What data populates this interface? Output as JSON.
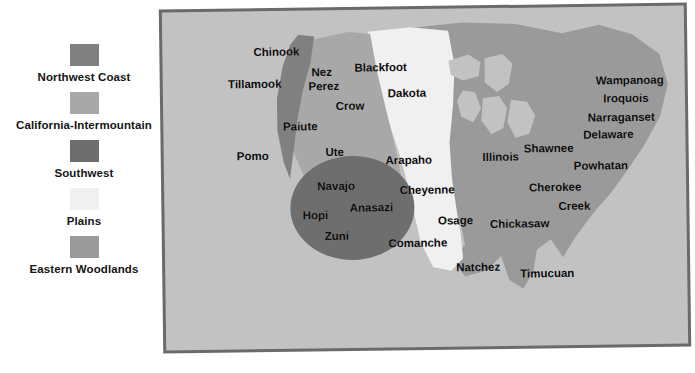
{
  "legend": {
    "items": [
      {
        "label": "Northwest Coast",
        "color": "#808080"
      },
      {
        "label": "California-Intermountain",
        "color": "#a8a8a8"
      },
      {
        "label": "Southwest",
        "color": "#6e6e6e"
      },
      {
        "label": "Plains",
        "color": "#f0f0f0"
      },
      {
        "label": "Eastern Woodlands",
        "color": "#9a9a9a"
      }
    ]
  },
  "map": {
    "colors": {
      "ocean": "#c2c2c2",
      "border": "#6a6a6a",
      "northwest_coast": "#808080",
      "california_intermountain": "#a8a8a8",
      "southwest": "#6e6e6e",
      "plains": "#f0f0f0",
      "eastern_woodlands": "#9a9a9a",
      "lakes": "#c2c2c2"
    },
    "tribes": [
      {
        "name": "Chinook",
        "x": 114,
        "y": 41,
        "region": "northwest_coast"
      },
      {
        "name": "Tillamook",
        "x": 92,
        "y": 73,
        "region": "northwest_coast"
      },
      {
        "name": "Nez",
        "x": 159,
        "y": 62,
        "region": "california_intermountain"
      },
      {
        "name": "Perez",
        "x": 161,
        "y": 76,
        "region": "california_intermountain"
      },
      {
        "name": "Blackfoot",
        "x": 218,
        "y": 58,
        "region": "plains"
      },
      {
        "name": "Dakota",
        "x": 244,
        "y": 84,
        "region": "plains"
      },
      {
        "name": "Crow",
        "x": 187,
        "y": 96,
        "region": "california_intermountain"
      },
      {
        "name": "Paiute",
        "x": 137,
        "y": 116,
        "region": "california_intermountain"
      },
      {
        "name": "Pomo",
        "x": 89,
        "y": 145,
        "region": "california_intermountain"
      },
      {
        "name": "Ute",
        "x": 171,
        "y": 142,
        "region": "california_intermountain"
      },
      {
        "name": "Arapaho",
        "x": 245,
        "y": 151,
        "region": "plains"
      },
      {
        "name": "Navajo",
        "x": 172,
        "y": 176,
        "region": "southwest"
      },
      {
        "name": "Anasazi",
        "x": 207,
        "y": 198,
        "region": "southwest"
      },
      {
        "name": "Hopi",
        "x": 151,
        "y": 205,
        "region": "southwest"
      },
      {
        "name": "Zuni",
        "x": 172,
        "y": 226,
        "region": "southwest"
      },
      {
        "name": "Cheyenne",
        "x": 263,
        "y": 181,
        "region": "plains"
      },
      {
        "name": "Osage",
        "x": 291,
        "y": 212,
        "region": "plains"
      },
      {
        "name": "Comanche",
        "x": 253,
        "y": 234,
        "region": "plains"
      },
      {
        "name": "Natchez",
        "x": 313,
        "y": 259,
        "region": "eastern_woodlands"
      },
      {
        "name": "Illinois",
        "x": 337,
        "y": 149,
        "region": "eastern_woodlands"
      },
      {
        "name": "Shawnee",
        "x": 385,
        "y": 141,
        "region": "eastern_woodlands"
      },
      {
        "name": "Wampanoag",
        "x": 467,
        "y": 74,
        "region": "eastern_woodlands"
      },
      {
        "name": "Iroquois",
        "x": 463,
        "y": 92,
        "region": "eastern_woodlands"
      },
      {
        "name": "Narraganset",
        "x": 458,
        "y": 111,
        "region": "eastern_woodlands"
      },
      {
        "name": "Delaware",
        "x": 445,
        "y": 128,
        "region": "eastern_woodlands"
      },
      {
        "name": "Powhatan",
        "x": 437,
        "y": 159,
        "region": "eastern_woodlands"
      },
      {
        "name": "Cherokee",
        "x": 391,
        "y": 180,
        "region": "eastern_woodlands"
      },
      {
        "name": "Creek",
        "x": 410,
        "y": 199,
        "region": "eastern_woodlands"
      },
      {
        "name": "Chickasaw",
        "x": 355,
        "y": 216,
        "region": "eastern_woodlands"
      },
      {
        "name": "Timucuan",
        "x": 382,
        "y": 266,
        "region": "eastern_woodlands"
      }
    ]
  }
}
